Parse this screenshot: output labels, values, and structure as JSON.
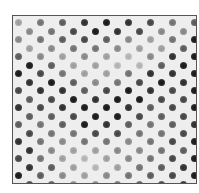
{
  "image": {
    "description": "Grayscale micrograph of a hexagonally ordered array of dark circular pores/dots",
    "frame": {
      "border_color": "#555555",
      "background": "#eeeeee"
    },
    "lattice": {
      "row_spacing_px": 8.5,
      "in_row_period_px": 22,
      "alternate_row_offset_px": 11,
      "dot_diameter_px": 7
    },
    "rows": [
      [
        0.3,
        0.5,
        0.6,
        0.8,
        0.9,
        0.8,
        0.7,
        0.5,
        0.6
      ],
      [
        0.4,
        0.5,
        0.7,
        0.9,
        0.8,
        0.7,
        0.4,
        0.4,
        0.8
      ],
      [
        0.4,
        0.5,
        0.6,
        0.7,
        0.6,
        0.4,
        0.3,
        0.5,
        0.9
      ],
      [
        0.3,
        0.4,
        0.5,
        0.5,
        0.4,
        0.3,
        0.3,
        0.6,
        0.9
      ],
      [
        0.6,
        0.4,
        0.3,
        0.4,
        0.3,
        0.2,
        0.4,
        0.8,
        0.9
      ],
      [
        0.9,
        0.6,
        0.3,
        0.3,
        0.2,
        0.2,
        0.6,
        0.9,
        0.9
      ],
      [
        0.9,
        0.7,
        0.5,
        0.3,
        0.3,
        0.5,
        0.8,
        0.8,
        0.9
      ],
      [
        0.8,
        0.9,
        0.6,
        0.4,
        0.5,
        0.7,
        0.9,
        0.8,
        0.9
      ],
      [
        0.7,
        0.8,
        0.8,
        0.6,
        0.7,
        0.9,
        0.8,
        0.7,
        0.9
      ],
      [
        0.6,
        0.7,
        0.9,
        0.8,
        0.9,
        0.9,
        0.7,
        0.7,
        0.8
      ],
      [
        0.8,
        0.7,
        0.8,
        0.9,
        0.9,
        0.8,
        0.6,
        0.7,
        0.9
      ],
      [
        0.6,
        0.6,
        0.7,
        0.9,
        0.9,
        0.7,
        0.6,
        0.7,
        0.8
      ],
      [
        0.6,
        0.5,
        0.6,
        0.9,
        0.8,
        0.6,
        0.5,
        0.6,
        0.8
      ],
      [
        0.7,
        0.5,
        0.5,
        0.7,
        0.7,
        0.5,
        0.5,
        0.7,
        0.9
      ],
      [
        0.8,
        0.5,
        0.4,
        0.5,
        0.5,
        0.4,
        0.5,
        0.7,
        0.9
      ],
      [
        0.8,
        0.4,
        0.3,
        0.3,
        0.4,
        0.4,
        0.5,
        0.6,
        0.8
      ],
      [
        0.7,
        0.5,
        0.3,
        0.2,
        0.3,
        0.4,
        0.5,
        0.7,
        0.9
      ],
      [
        0.8,
        0.6,
        0.3,
        0.2,
        0.3,
        0.5,
        0.6,
        0.8,
        0.9
      ],
      [
        0.9,
        0.6,
        0.4,
        0.3,
        0.4,
        0.5,
        0.6,
        0.7,
        0.9
      ],
      [
        0.7,
        0.6,
        0.4,
        0.4,
        0.5,
        0.6,
        0.7,
        0.8,
        0.9
      ]
    ]
  }
}
